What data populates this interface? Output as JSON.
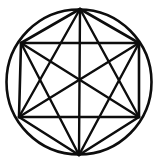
{
  "figure": {
    "background_color": "#ffffff",
    "stroke_color": "#0d0d0d",
    "canvas": {
      "width": 157,
      "height": 164
    },
    "circle": {
      "label": "circumscribed-circle",
      "cx": 79,
      "cy": 82,
      "r": 72.5,
      "stroke_width": 2.6
    },
    "vertices": [
      {
        "id": "v-top",
        "label": "Top",
        "x": 80,
        "y": 9
      },
      {
        "id": "v-upper-right",
        "label": "Upper right",
        "x": 139,
        "y": 43
      },
      {
        "id": "v-lower-right",
        "label": "Lower right",
        "x": 139,
        "y": 117
      },
      {
        "id": "v-bottom",
        "label": "Bottom",
        "x": 79,
        "y": 155
      },
      {
        "id": "v-lower-left",
        "label": "Lower left",
        "x": 19,
        "y": 117
      },
      {
        "id": "v-upper-left",
        "label": "Upper left",
        "x": 21,
        "y": 43
      }
    ],
    "hexagon_edges": [
      {
        "id": "edge-top-to-upper-right",
        "from": 0,
        "to": 1
      },
      {
        "id": "edge-upper-right-to-lower-right",
        "from": 1,
        "to": 2
      },
      {
        "id": "edge-lower-right-to-bottom",
        "from": 2,
        "to": 3
      },
      {
        "id": "edge-bottom-to-lower-left",
        "from": 3,
        "to": 4
      },
      {
        "id": "edge-lower-left-to-upper-left",
        "from": 4,
        "to": 5
      },
      {
        "id": "edge-upper-left-to-top",
        "from": 5,
        "to": 0
      }
    ],
    "short_diagonals": [
      {
        "id": "diag-top-to-lower-right",
        "from": 0,
        "to": 2
      },
      {
        "id": "diag-upper-right-to-bottom",
        "from": 1,
        "to": 3
      },
      {
        "id": "diag-lower-right-to-lower-left",
        "from": 2,
        "to": 4
      },
      {
        "id": "diag-bottom-to-upper-left",
        "from": 3,
        "to": 5
      },
      {
        "id": "diag-lower-left-to-top",
        "from": 4,
        "to": 0
      },
      {
        "id": "diag-upper-left-to-upper-right",
        "from": 5,
        "to": 1
      }
    ],
    "long_diagonals": [
      {
        "id": "main-top-to-bottom",
        "from": 0,
        "to": 3
      },
      {
        "id": "main-upper-right-to-lower-left",
        "from": 1,
        "to": 4
      },
      {
        "id": "main-lower-right-to-upper-left",
        "from": 2,
        "to": 5
      }
    ]
  }
}
